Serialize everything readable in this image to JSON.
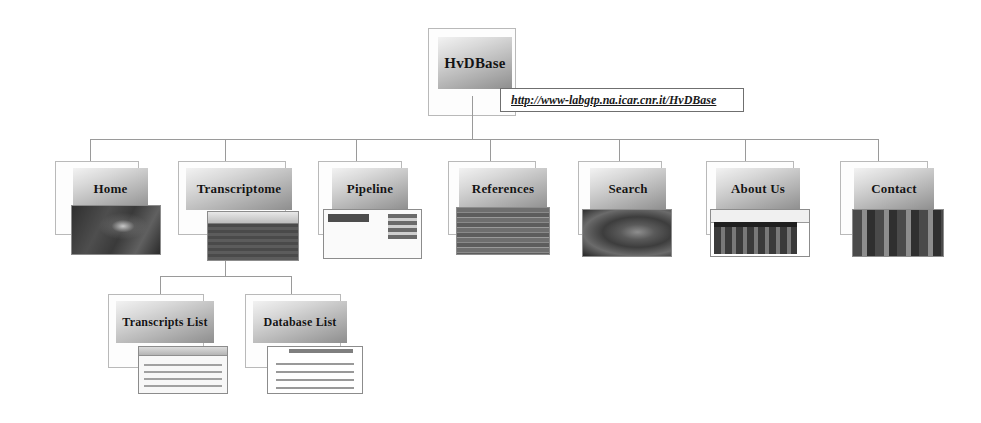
{
  "diagram": {
    "root": {
      "label": "HvDBase",
      "url": "http://www-labgtp.na.icar.cnr.it/HvDBase"
    },
    "level1": [
      {
        "label": "Home",
        "thumb": "photo-dark-thumbnail"
      },
      {
        "label": "Transcriptome",
        "thumb": "browser-window-thumbnail"
      },
      {
        "label": "Pipeline",
        "thumb": "pipeline-form-thumbnail"
      },
      {
        "label": "References",
        "thumb": "reference-table-thumbnail"
      },
      {
        "label": "Search",
        "thumb": "hand-photo-thumbnail"
      },
      {
        "label": "About Us",
        "thumb": "group-photo-browser-thumbnail"
      },
      {
        "label": "Contact",
        "thumb": "people-photo-thumbnail"
      }
    ],
    "level2": [
      {
        "label": "Transcripts List",
        "parent": "Transcriptome",
        "thumb": "transcripts-table-thumbnail"
      },
      {
        "label": "Database List",
        "parent": "Transcriptome",
        "thumb": "database-list-thumbnail"
      }
    ],
    "colors": {
      "line": "#9a9a9a",
      "card_border": "#b9b9b9",
      "plate_light": "#f2f2f2",
      "plate_dark": "#8e8e8e",
      "text": "#141414"
    }
  }
}
